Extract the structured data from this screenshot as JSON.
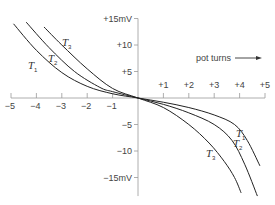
{
  "chart_data": {
    "type": "line",
    "title": "",
    "xlabel": "pot turns",
    "ylabel": "mV",
    "xlim": [
      -5,
      5
    ],
    "ylim": [
      -15,
      15
    ],
    "grid": false,
    "x_ticks": [
      "-5",
      "-4",
      "-3",
      "-2",
      "-1",
      "+1",
      "+2",
      "+3",
      "+4",
      "+5"
    ],
    "y_ticks": [
      "+15mV",
      "+10",
      "+5",
      "-5",
      "-10",
      "-15mV"
    ],
    "annotation": "pot turns",
    "series": [
      {
        "name": "T1",
        "label": "T",
        "sub": "1",
        "x": [
          -4.9,
          -4.0,
          -3.0,
          -2.0,
          -1.0,
          0,
          1.0,
          2.0,
          3.0,
          3.8,
          4.3,
          4.8
        ],
        "y": [
          14.0,
          9.0,
          4.8,
          2.2,
          0.8,
          0,
          -0.8,
          -1.8,
          -3.2,
          -5.0,
          -8.0,
          -12.8
        ]
      },
      {
        "name": "T2",
        "label": "T",
        "sub": "2",
        "x": [
          -4.4,
          -3.5,
          -2.5,
          -1.5,
          -1.0,
          0,
          1.0,
          2.0,
          3.0,
          3.7,
          4.2,
          4.7
        ],
        "y": [
          14.3,
          9.5,
          5.0,
          2.0,
          1.2,
          0,
          -1.2,
          -2.8,
          -5.0,
          -8.0,
          -12.5,
          -18.5
        ]
      },
      {
        "name": "T3",
        "label": "T",
        "sub": "3",
        "x": [
          -3.7,
          -3.0,
          -2.0,
          -1.0,
          0,
          1.0,
          2.0,
          2.8,
          3.4,
          3.8,
          4.06
        ],
        "y": [
          13.4,
          10.0,
          5.5,
          1.8,
          0,
          -1.8,
          -5.0,
          -8.5,
          -12.0,
          -15.0,
          -17.9
        ]
      }
    ]
  }
}
